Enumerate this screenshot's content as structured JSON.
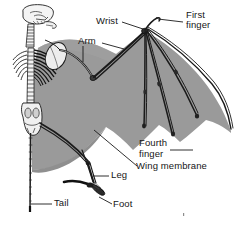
{
  "figure": {
    "background_color": "#ffffff",
    "membrane_color": "#9a9a9a",
    "membrane_shadow_color": "#8a8a8a",
    "bone_outline_color": "#1a1a1a",
    "bone_fill_color": "#f2f2f2",
    "leader_line_color": "#1a1a1a",
    "text_color": "#161616"
  },
  "labels": {
    "wrist": "Wrist",
    "first_finger_line1": "First",
    "first_finger_line2": "finger",
    "arm": "Arm",
    "fourth_finger_line1": "Fourth",
    "fourth_finger_line2": "finger",
    "wing_membrane": "Wing membrane",
    "leg": "Leg",
    "foot": "Foot",
    "tail": "Tail"
  },
  "parts": [
    {
      "name": "skull",
      "label": ""
    },
    {
      "name": "cervical-vertebrae",
      "label": ""
    },
    {
      "name": "ribcage",
      "label": ""
    },
    {
      "name": "scapula",
      "label": ""
    },
    {
      "name": "spine",
      "label": ""
    },
    {
      "name": "pelvis",
      "label": ""
    },
    {
      "name": "tail",
      "label": "Tail"
    },
    {
      "name": "arm",
      "label": "Arm"
    },
    {
      "name": "wrist",
      "label": "Wrist"
    },
    {
      "name": "first-finger",
      "label": "First finger"
    },
    {
      "name": "second-finger",
      "label": ""
    },
    {
      "name": "third-finger",
      "label": ""
    },
    {
      "name": "fourth-finger",
      "label": "Fourth finger"
    },
    {
      "name": "fifth-finger",
      "label": ""
    },
    {
      "name": "leg",
      "label": "Leg"
    },
    {
      "name": "foot",
      "label": "Foot"
    },
    {
      "name": "wing-membrane",
      "label": "Wing membrane"
    }
  ]
}
